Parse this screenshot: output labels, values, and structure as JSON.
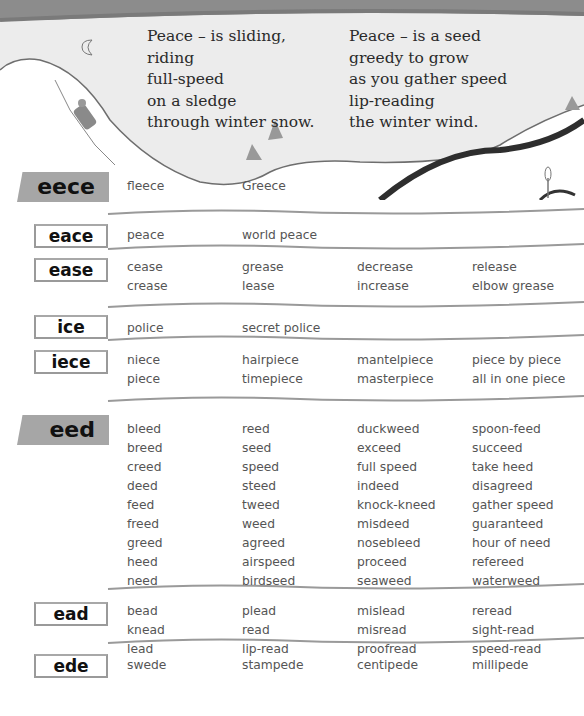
{
  "poem": {
    "left": [
      "Peace – is sliding,",
      "riding",
      "full-speed",
      "on a sledge",
      "through winter snow."
    ],
    "right": [
      "Peace – is a seed",
      "greedy to grow",
      "as you gather speed",
      "lip-reading",
      "the winter wind."
    ]
  },
  "icons": [
    "moon-icon",
    "sledge-rider-icon",
    "snow-mound-icon",
    "sprout-icon"
  ],
  "colors": {
    "band": "#8c8c8c",
    "snow": "#ececec",
    "label_fill": "#a6a6a6",
    "line": "#9a9a9a",
    "path": "#2e2e2e"
  },
  "sections": [
    {
      "label": "eece",
      "style": "big",
      "columns": [
        [
          "fleece"
        ],
        [
          "Greece"
        ],
        [],
        []
      ]
    },
    {
      "label": "eace",
      "style": "box",
      "columns": [
        [
          "peace"
        ],
        [
          "world peace"
        ],
        [],
        []
      ]
    },
    {
      "label": "ease",
      "style": "box",
      "columns": [
        [
          "cease",
          "crease"
        ],
        [
          "grease",
          "lease"
        ],
        [
          "decrease",
          "increase"
        ],
        [
          "release",
          "elbow grease"
        ]
      ]
    },
    {
      "label": "ice",
      "style": "box",
      "columns": [
        [
          "police"
        ],
        [
          "secret police"
        ],
        [],
        []
      ]
    },
    {
      "label": "iece",
      "style": "box",
      "columns": [
        [
          "niece",
          "piece"
        ],
        [
          "hairpiece",
          "timepiece"
        ],
        [
          "mantelpiece",
          "masterpiece"
        ],
        [
          "piece by piece",
          "all in one piece"
        ]
      ]
    },
    {
      "label": "eed",
      "style": "big",
      "columns": [
        [
          "bleed",
          "breed",
          "creed",
          "deed",
          "feed",
          "freed",
          "greed",
          "heed",
          "need"
        ],
        [
          "reed",
          "seed",
          "speed",
          "steed",
          "tweed",
          "weed",
          "agreed",
          "airspeed",
          "birdseed"
        ],
        [
          "duckweed",
          "exceed",
          "full speed",
          "indeed",
          "knock-kneed",
          "misdeed",
          "nosebleed",
          "proceed",
          "seaweed"
        ],
        [
          "spoon-feed",
          "succeed",
          "take heed",
          "disagreed",
          "gather speed",
          "guaranteed",
          "hour of need",
          "refereed",
          "waterweed"
        ]
      ]
    },
    {
      "label": "ead",
      "style": "box",
      "columns": [
        [
          "bead",
          "knead",
          "lead"
        ],
        [
          "plead",
          "read",
          "lip-read"
        ],
        [
          "mislead",
          "misread",
          "proofread"
        ],
        [
          "reread",
          "sight-read",
          "speed-read"
        ]
      ]
    },
    {
      "label": "ede",
      "style": "box",
      "columns": [
        [
          "swede"
        ],
        [
          "stampede"
        ],
        [
          "centipede"
        ],
        [
          "millipede"
        ]
      ]
    }
  ]
}
